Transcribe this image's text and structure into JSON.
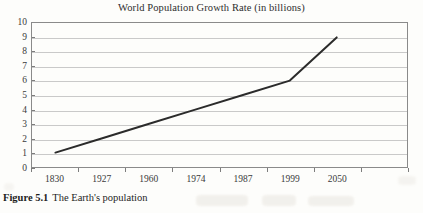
{
  "figure": {
    "caption_label": "Figure 5.1",
    "caption_text": "The Earth's population"
  },
  "chart_data": {
    "type": "line",
    "title": "World Population Growth Rate (in billions)",
    "xlabel": "",
    "ylabel": "",
    "categories": [
      "1830",
      "1927",
      "1960",
      "1974",
      "1987",
      "1999",
      "2050"
    ],
    "x": [
      1830,
      1927,
      1960,
      1974,
      1987,
      1999,
      2050
    ],
    "values": [
      1,
      2,
      3,
      4,
      5,
      6,
      9
    ],
    "series": [
      {
        "name": "World population",
        "values": [
          1,
          2,
          3,
          4,
          5,
          6,
          9
        ]
      }
    ],
    "ylim": [
      0,
      10
    ],
    "yticks": [
      0,
      1,
      2,
      3,
      4,
      5,
      6,
      7,
      8,
      9,
      10
    ],
    "ytick_labels": [
      "0",
      "1",
      "2",
      "3",
      "4",
      "5",
      "6",
      "7",
      "8",
      "9",
      "10"
    ],
    "grid": "horizontal",
    "legend": "none",
    "line_color": "#2b2b2b",
    "grid_color": "#c9c9c9",
    "frame_color": "#8a8a8a"
  }
}
